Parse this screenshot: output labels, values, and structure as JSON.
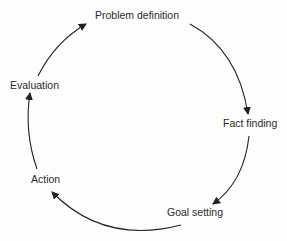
{
  "diagram": {
    "type": "cycle",
    "nodes": [
      {
        "id": "problem",
        "label": "Problem definition"
      },
      {
        "id": "fact",
        "label": "Fact finding"
      },
      {
        "id": "goal",
        "label": "Goal setting"
      },
      {
        "id": "action",
        "label": "Action"
      },
      {
        "id": "evaluation",
        "label": "Evaluation"
      }
    ],
    "edges": [
      {
        "from": "problem",
        "to": "fact"
      },
      {
        "from": "fact",
        "to": "goal"
      },
      {
        "from": "goal",
        "to": "action"
      },
      {
        "from": "action",
        "to": "evaluation"
      },
      {
        "from": "evaluation",
        "to": "problem"
      }
    ],
    "colors": {
      "line": "#222222",
      "text": "#2a2a2a",
      "background": "#fdfdfd"
    }
  }
}
